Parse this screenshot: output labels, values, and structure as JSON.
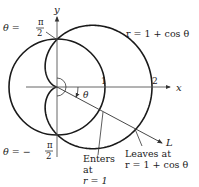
{
  "diagram": {
    "curve_label": "r = 1 + cos θ",
    "axes": {
      "x_label": "x",
      "y_label": "y"
    },
    "ticks": {
      "one": "1",
      "two": "2"
    },
    "angle_label": "θ",
    "line_label": "L",
    "theta_top": {
      "prefix": "θ =",
      "num": "π",
      "den": "2"
    },
    "theta_bottom": {
      "prefix": "θ = −",
      "num": "π",
      "den": "2"
    },
    "enters": {
      "line1": "Enters",
      "line2": "at",
      "line3": "r = 1"
    },
    "leaves": {
      "line1": "Leaves at",
      "line2": "r = 1 + cos θ"
    },
    "colors": {
      "curve": "#1a1a1a",
      "axis": "#555555"
    }
  }
}
